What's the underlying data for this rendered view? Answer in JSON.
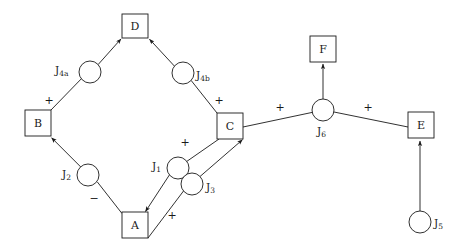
{
  "diagram": {
    "background_color": "#ffffff",
    "stroke_color": "#1a1a1a",
    "boxes": [
      {
        "id": "D",
        "label": "D",
        "x": 135,
        "y": 26,
        "w": 26,
        "h": 24
      },
      {
        "id": "B",
        "label": "B",
        "x": 38,
        "y": 123,
        "w": 26,
        "h": 26
      },
      {
        "id": "C",
        "label": "C",
        "x": 230,
        "y": 126,
        "w": 26,
        "h": 26
      },
      {
        "id": "A",
        "label": "A",
        "x": 135,
        "y": 225,
        "w": 26,
        "h": 26
      },
      {
        "id": "F",
        "label": "F",
        "x": 323,
        "y": 49,
        "w": 26,
        "h": 26
      },
      {
        "id": "E",
        "label": "E",
        "x": 421,
        "y": 125,
        "w": 26,
        "h": 26
      }
    ],
    "junctions": [
      {
        "id": "J4a",
        "label": "J",
        "sub": "4a",
        "cx": 90,
        "cy": 72,
        "r": 11,
        "label_x": 55,
        "label_y": 71
      },
      {
        "id": "J4b",
        "label": "J",
        "sub": "4b",
        "cx": 183,
        "cy": 73,
        "r": 11,
        "label_x": 196,
        "label_y": 76
      },
      {
        "id": "J2",
        "label": "J",
        "sub": "2",
        "cx": 88,
        "cy": 175,
        "r": 11,
        "label_x": 62,
        "label_y": 175
      },
      {
        "id": "J1",
        "label": "J",
        "sub": "1",
        "cx": 178,
        "cy": 168,
        "r": 11,
        "label_x": 152,
        "label_y": 167
      },
      {
        "id": "J3",
        "label": "J",
        "sub": "3",
        "cx": 192,
        "cy": 184,
        "r": 11,
        "label_x": 206,
        "label_y": 188
      },
      {
        "id": "J6",
        "label": "J",
        "sub": "6",
        "cx": 323,
        "cy": 110,
        "r": 11,
        "label_x": 317,
        "label_y": 132
      },
      {
        "id": "J5",
        "label": "J",
        "sub": "5",
        "cx": 420,
        "cy": 222,
        "r": 11,
        "label_x": 434,
        "label_y": 224
      }
    ],
    "signs": [
      {
        "id": "sign-b-j4a",
        "text": "+",
        "x": 49,
        "y": 101
      },
      {
        "id": "sign-c-j4b",
        "text": "+",
        "x": 219,
        "y": 101
      },
      {
        "id": "sign-j2-a",
        "text": "−",
        "x": 94,
        "y": 199
      },
      {
        "id": "sign-c-j1",
        "text": "+",
        "x": 185,
        "y": 143
      },
      {
        "id": "sign-a-j3",
        "text": "+",
        "x": 172,
        "y": 216
      },
      {
        "id": "sign-c-j6",
        "text": "+",
        "x": 280,
        "y": 108
      },
      {
        "id": "sign-j6-e",
        "text": "+",
        "x": 368,
        "y": 108
      }
    ],
    "edges": [
      {
        "id": "edge-b-to-j4a",
        "from": "B",
        "to": "J4a",
        "arrow": false
      },
      {
        "id": "edge-j4a-to-d",
        "from": "J4a",
        "to": "D",
        "arrow": true
      },
      {
        "id": "edge-c-to-j4b",
        "from": "C",
        "to": "J4b",
        "arrow": false
      },
      {
        "id": "edge-j4b-to-d",
        "from": "J4b",
        "to": "D",
        "arrow": true
      },
      {
        "id": "edge-a-to-j2",
        "from": "A",
        "to": "J2",
        "arrow": false
      },
      {
        "id": "edge-j2-to-b",
        "from": "J2",
        "to": "B",
        "arrow": true
      },
      {
        "id": "edge-c-to-j1",
        "from": "C",
        "to": "J1",
        "arrow": false
      },
      {
        "id": "edge-j1-to-a",
        "from": "J1",
        "to": "A",
        "arrow": true
      },
      {
        "id": "edge-a-to-j3",
        "from": "A",
        "to": "J3",
        "arrow": false
      },
      {
        "id": "edge-j3-to-c",
        "from": "J3",
        "to": "C",
        "arrow": true
      },
      {
        "id": "edge-c-to-j6",
        "from": "C",
        "to": "J6",
        "arrow": false
      },
      {
        "id": "edge-j6-to-f",
        "from": "J6",
        "to": "F",
        "arrow": true
      },
      {
        "id": "edge-j6-to-e",
        "from": "J6",
        "to": "E",
        "arrow": false
      },
      {
        "id": "edge-j5-to-e",
        "from": "J5",
        "to": "E",
        "arrow": true
      }
    ]
  }
}
